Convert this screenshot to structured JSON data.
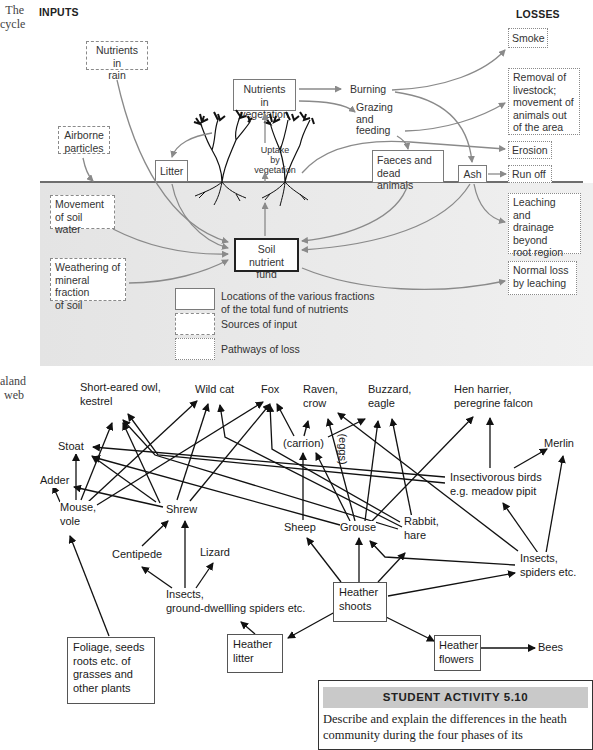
{
  "captions": {
    "nutrient_cycle": "The\ncycle",
    "food_web": "aland\nweb"
  },
  "nutrient_cycle": {
    "inputs_heading": "INPUTS",
    "losses_heading": "LOSSES",
    "nodes": {
      "nutrients_in_rain": "Nutrients in\nrain",
      "airborne_particles": "Airborne\nparticles",
      "nutrients_in_vegetation": "Nutrients in\nvegetation",
      "litter": "Litter",
      "uptake_by_vegetation": "Uptake\nby\nvegetation",
      "burning": "Burning",
      "grazing_and_feeding": "Grazing\nand\nfeeding",
      "faeces_and_dead_animals": "Faeces and\ndead animals",
      "ash": "Ash",
      "smoke": "Smoke",
      "removal_of_livestock": "Removal of\nlivestock;\nmovement of\nanimals out\nof the area",
      "erosion": "Erosion",
      "run_off": "Run off",
      "movement_of_soil_water": "Movement\nof soil water",
      "weathering": "Weathering of\nmineral fraction\nof soil",
      "soil_nutrient_fund": "Soil nutrient\nfund",
      "leaching_and_drainage": "Leaching and\ndrainage\nbeyond\nroot region",
      "normal_loss_by_leaching": "Normal loss\nby leaching"
    },
    "legend": [
      {
        "style": "solid",
        "label": "Locations of the various fractions\nof the total fund of nutrients"
      },
      {
        "style": "dashed",
        "label": "Sources of input"
      },
      {
        "style": "dotted",
        "label": "Pathways of loss"
      }
    ]
  },
  "food_web": {
    "nodes": {
      "short_eared_owl": "Short-eared owl,\nkestrel",
      "wild_cat": "Wild cat",
      "fox": "Fox",
      "raven": "Raven,\ncrow",
      "buzzard": "Buzzard,\neagle",
      "hen_harrier": "Hen harrier,\nperegrine falcon",
      "merlin": "Merlin",
      "stoat": "Stoat",
      "carrion": "(carrion)",
      "eggs": "(eggs)",
      "adder": "Adder",
      "insectivorous_birds": "Insectivorous birds\ne.g. meadow pipit",
      "mouse_vole": "Mouse,\nvole",
      "shrew": "Shrew",
      "sheep": "Sheep",
      "grouse": "Grouse",
      "rabbit_hare": "Rabbit,\nhare",
      "centipede": "Centipede",
      "lizard": "Lizard",
      "insects_spiders": "Insects,\nspiders etc.",
      "insects_ground": "Insects,\nground-dwellling spiders etc.",
      "heather_shoots": "Heather\nshoots",
      "foliage": "Foliage, seeds\nroots etc. of\ngrasses and\nother plants",
      "heather_litter": "Heather\nlitter",
      "heather_flowers": "Heather\nflowers",
      "bees": "Bees"
    }
  },
  "student_activity": {
    "title": "STUDENT ACTIVITY 5.10",
    "text": "Describe and explain the differences in the heath community during the four phases of its"
  },
  "colors": {
    "flow_arrow": "#8a8a8a",
    "food_arrow": "#111111",
    "soil_fill": "#e6e6e6",
    "activity_header": "#c9c9c9"
  }
}
